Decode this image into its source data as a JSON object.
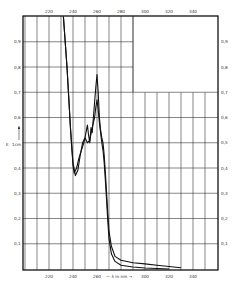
{
  "chart_data": {
    "type": "line",
    "title": "",
    "xlabel": "λ in nm",
    "ylabel": "E 1cm",
    "xlim": [
      198,
      361
    ],
    "ylim": [
      0,
      1.0
    ],
    "grid": true,
    "x_ticks": [
      220,
      240,
      260,
      280,
      300,
      320,
      340
    ],
    "x_tick_labels_top": [
      "220",
      "240",
      "260",
      "280",
      "300",
      "320",
      "340"
    ],
    "x_tick_labels_bottom": [
      "220",
      "240",
      "260",
      "300",
      "320",
      "340"
    ],
    "y_ticks": [
      0.1,
      0.2,
      0.3,
      0.4,
      0.6,
      0.7,
      0.8,
      0.9
    ],
    "y_tick_labels": [
      "0,1",
      "0,2",
      "0,3",
      "0,4",
      "0,6",
      "0,7",
      "0,8",
      "0,9"
    ],
    "y_tick_labels_right": [
      "0,1",
      "0,2",
      "0,3",
      "0,4",
      "0,5",
      "0,6",
      "0,7",
      "0,8",
      "0,9"
    ],
    "series": [
      {
        "name": "curve-1",
        "x": [
          232,
          235,
          238,
          240,
          242,
          244,
          246,
          248,
          250,
          252,
          253,
          254,
          255,
          256,
          257,
          258,
          259,
          260,
          261,
          262,
          263,
          264,
          265,
          266,
          267,
          268,
          269,
          270,
          272,
          275,
          280,
          290,
          300,
          310,
          320,
          330
        ],
        "y": [
          1.0,
          0.8,
          0.55,
          0.42,
          0.37,
          0.39,
          0.45,
          0.5,
          0.52,
          0.57,
          0.53,
          0.5,
          0.56,
          0.54,
          0.6,
          0.66,
          0.72,
          0.77,
          0.7,
          0.6,
          0.55,
          0.52,
          0.5,
          0.45,
          0.38,
          0.3,
          0.22,
          0.15,
          0.09,
          0.05,
          0.035,
          0.025,
          0.02,
          0.015,
          0.01,
          0.005
        ]
      },
      {
        "name": "curve-2",
        "x": [
          232,
          235,
          238,
          240,
          241,
          243,
          245,
          247,
          249,
          250,
          252,
          254,
          256,
          258,
          259,
          260,
          261,
          262,
          263,
          264,
          265,
          266,
          267,
          268,
          269,
          270,
          272,
          275,
          280,
          290,
          300,
          310,
          320
        ],
        "y": [
          1.0,
          0.8,
          0.55,
          0.41,
          0.38,
          0.4,
          0.44,
          0.47,
          0.5,
          0.52,
          0.5,
          0.51,
          0.56,
          0.6,
          0.64,
          0.67,
          0.63,
          0.58,
          0.54,
          0.5,
          0.47,
          0.42,
          0.35,
          0.27,
          0.19,
          0.12,
          0.06,
          0.03,
          0.015,
          0.008,
          0.004,
          0.002,
          0.0
        ]
      }
    ],
    "annotations": [
      "E 1cm ↑",
      "— λ in nm →"
    ]
  },
  "axis_labels": {
    "y_left_unit": "E",
    "y_left_unit_sub": "1cm",
    "x_bottom_label": "— λ in nm →"
  }
}
